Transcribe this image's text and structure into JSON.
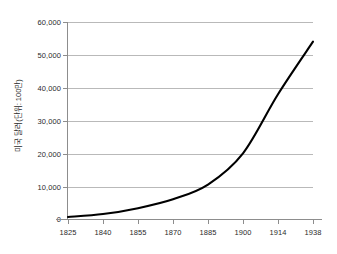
{
  "chart_data": {
    "type": "line",
    "title": "",
    "xlabel": "",
    "ylabel": "미국 달러(단위: 100만)",
    "xlim": [
      1825,
      1938
    ],
    "ylim": [
      0,
      60000
    ],
    "grid": true,
    "legend": "none",
    "x_tick_labels": [
      "1825",
      "1840",
      "1855",
      "1870",
      "1885",
      "1900",
      "1914",
      "1938"
    ],
    "y_tick_labels": [
      "0",
      "10,000",
      "20,000",
      "30,000",
      "40,000",
      "50,000",
      "60,000"
    ],
    "y_tick_values": [
      0,
      10000,
      20000,
      30000,
      40000,
      50000,
      60000
    ],
    "series": [
      {
        "name": "미국 달러(단위: 100만)",
        "color": "#000000",
        "x": [
          1825,
          1840,
          1855,
          1870,
          1885,
          1900,
          1914,
          1938
        ],
        "values": [
          600,
          1500,
          3300,
          6000,
          10500,
          20000,
          38000,
          54000
        ],
        "points": [
          {
            "x": 1825,
            "y": 600
          },
          {
            "x": 1840,
            "y": 1500
          },
          {
            "x": 1855,
            "y": 3300
          },
          {
            "x": 1870,
            "y": 6000
          },
          {
            "x": 1885,
            "y": 10500
          },
          {
            "x": 1900,
            "y": 20000
          },
          {
            "x": 1914,
            "y": 38000
          },
          {
            "x": 1938,
            "y": 54000
          }
        ]
      }
    ]
  },
  "axis": {
    "y_title": "미국 달러(단위: 100만)",
    "y_ticks": [
      {
        "label": "60,000"
      },
      {
        "label": "50,000"
      },
      {
        "label": "40,000"
      },
      {
        "label": "30,000"
      },
      {
        "label": "20,000"
      },
      {
        "label": "10,000"
      },
      {
        "label": "0"
      }
    ],
    "x_ticks": [
      {
        "label": "1825"
      },
      {
        "label": "1840"
      },
      {
        "label": "1855"
      },
      {
        "label": "1870"
      },
      {
        "label": "1885"
      },
      {
        "label": "1900"
      },
      {
        "label": "1914"
      },
      {
        "label": "1938"
      }
    ]
  },
  "header": {
    "title_fragment": ""
  },
  "colors": {
    "series_line": "#000000",
    "gridline": "#b9b9b9",
    "axis": "#8d8d8d",
    "text": "#2b2b2b",
    "background": "#ffffff"
  }
}
